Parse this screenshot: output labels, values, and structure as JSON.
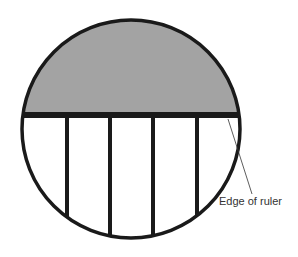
{
  "diagram": {
    "title": "",
    "labels": {
      "ruler_edge": "Edge of ruler"
    },
    "colors": {
      "shaded_region": "#a3a3a3",
      "outline": "#1a1a1a",
      "background": "#ffffff"
    }
  }
}
